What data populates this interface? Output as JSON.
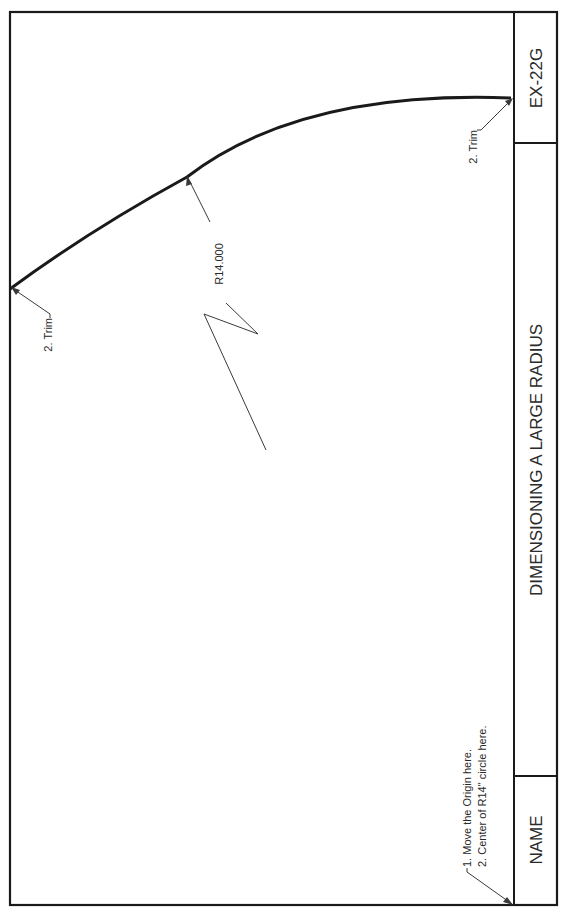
{
  "title_block": {
    "drawing_number": "EX-22G",
    "title": "DIMENSIONING A LARGE RADIUS",
    "name_label": "NAME"
  },
  "drawing": {
    "radius_dimension": "R14.000",
    "trim_note_left": "2. Trim",
    "trim_note_right": "2. Trim",
    "origin_notes": [
      "1.  Move the Origin here.",
      "2.  Center of R14\" circle here."
    ]
  },
  "colors": {
    "line": "#1a1a1a",
    "thin_line": "#3a3a3a",
    "background": "#ffffff"
  }
}
